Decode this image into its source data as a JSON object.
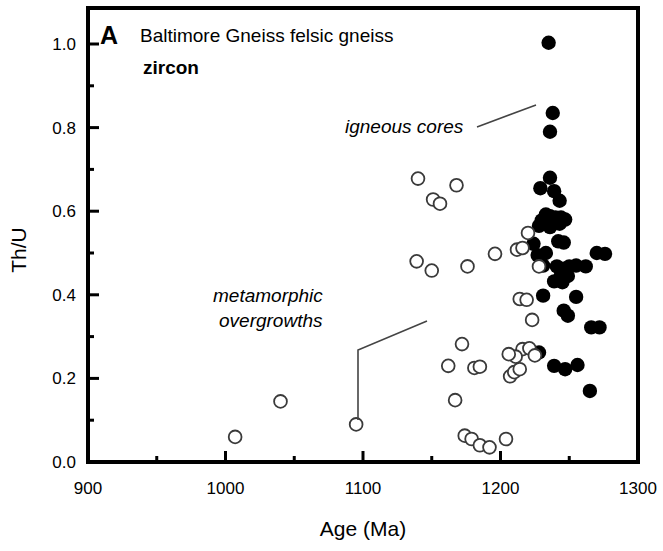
{
  "figure": {
    "panel_label": "A",
    "title_line1": "Baltimore Gneiss felsic gneiss",
    "title_line2": "zircon",
    "annotations": [
      {
        "name": "igneous-cores",
        "text": "igneous cores",
        "text_x": 345,
        "text_y": 133,
        "leader": [
          [
            477,
            127
          ],
          [
            536,
            105
          ]
        ]
      },
      {
        "name": "metamorphic-overgrowths-line1",
        "text": "metamorphic",
        "text_x": 213,
        "text_y": 302,
        "leader": []
      },
      {
        "name": "metamorphic-overgrowths-line2",
        "text": "overgrowths",
        "text_x": 219,
        "text_y": 327,
        "leader": [
          [
            358,
            420
          ],
          [
            358,
            350
          ],
          [
            427,
            321
          ]
        ]
      }
    ]
  },
  "chart_data": {
    "type": "scatter",
    "xlabel": "Age (Ma)",
    "ylabel": "Th/U",
    "xlim": [
      900,
      1300
    ],
    "ylim": [
      0.0,
      1.086
    ],
    "xticks": [
      900,
      1000,
      1100,
      1200,
      1300
    ],
    "xticklabels": [
      "900",
      "1000",
      "1100",
      "1200",
      "1300"
    ],
    "xminorticks": [
      950,
      1050,
      1150,
      1250
    ],
    "yticks": [
      0.0,
      0.2,
      0.4,
      0.6,
      0.8,
      1.0
    ],
    "yticklabels": [
      "0.0",
      "0.2",
      "0.4",
      "0.6",
      "0.8",
      "1.0"
    ],
    "yminorticks": [
      0.1,
      0.3,
      0.5,
      0.7,
      0.9
    ],
    "grid": false,
    "legend": "none",
    "marker_colors": {
      "filled": "#000000",
      "open_stroke": "#3a3a3a",
      "open_fill": "#ffffff"
    },
    "series": [
      {
        "name": "igneous cores",
        "marker": "filled-circle",
        "points": [
          [
            1235,
            1.003
          ],
          [
            1238,
            0.835
          ],
          [
            1236,
            0.79
          ],
          [
            1236,
            0.68
          ],
          [
            1229,
            0.655
          ],
          [
            1239,
            0.648
          ],
          [
            1243,
            0.625
          ],
          [
            1233,
            0.592
          ],
          [
            1236,
            0.588
          ],
          [
            1240,
            0.585
          ],
          [
            1244,
            0.585
          ],
          [
            1230,
            0.578
          ],
          [
            1239,
            0.572
          ],
          [
            1243,
            0.57
          ],
          [
            1247,
            0.58
          ],
          [
            1236,
            0.562
          ],
          [
            1228,
            0.565
          ],
          [
            1242,
            0.528
          ],
          [
            1246,
            0.525
          ],
          [
            1224,
            0.522
          ],
          [
            1233,
            0.5
          ],
          [
            1227,
            0.495
          ],
          [
            1270,
            0.5
          ],
          [
            1276,
            0.498
          ],
          [
            1231,
            0.47
          ],
          [
            1241,
            0.468
          ],
          [
            1246,
            0.462
          ],
          [
            1250,
            0.468
          ],
          [
            1255,
            0.47
          ],
          [
            1244,
            0.448
          ],
          [
            1249,
            0.445
          ],
          [
            1262,
            0.468
          ],
          [
            1239,
            0.432
          ],
          [
            1245,
            0.43
          ],
          [
            1231,
            0.398
          ],
          [
            1255,
            0.395
          ],
          [
            1246,
            0.362
          ],
          [
            1249,
            0.35
          ],
          [
            1266,
            0.322
          ],
          [
            1272,
            0.322
          ],
          [
            1228,
            0.262
          ],
          [
            1239,
            0.23
          ],
          [
            1247,
            0.222
          ],
          [
            1256,
            0.232
          ],
          [
            1265,
            0.17
          ]
        ]
      },
      {
        "name": "metamorphic overgrowths",
        "marker": "open-circle",
        "points": [
          [
            1007,
            0.06
          ],
          [
            1040,
            0.145
          ],
          [
            1095,
            0.09
          ],
          [
            1140,
            0.678
          ],
          [
            1139,
            0.48
          ],
          [
            1150,
            0.458
          ],
          [
            1151,
            0.628
          ],
          [
            1156,
            0.618
          ],
          [
            1168,
            0.662
          ],
          [
            1162,
            0.23
          ],
          [
            1172,
            0.282
          ],
          [
            1167,
            0.148
          ],
          [
            1176,
            0.468
          ],
          [
            1181,
            0.225
          ],
          [
            1185,
            0.228
          ],
          [
            1174,
            0.063
          ],
          [
            1179,
            0.055
          ],
          [
            1185,
            0.04
          ],
          [
            1192,
            0.035
          ],
          [
            1196,
            0.498
          ],
          [
            1204,
            0.055
          ],
          [
            1207,
            0.205
          ],
          [
            1210,
            0.215
          ],
          [
            1214,
            0.222
          ],
          [
            1212,
            0.508
          ],
          [
            1216,
            0.512
          ],
          [
            1220,
            0.548
          ],
          [
            1214,
            0.39
          ],
          [
            1219,
            0.388
          ],
          [
            1223,
            0.34
          ],
          [
            1216,
            0.27
          ],
          [
            1221,
            0.272
          ],
          [
            1211,
            0.252
          ],
          [
            1206,
            0.258
          ],
          [
            1225,
            0.255
          ],
          [
            1228,
            0.468
          ]
        ]
      }
    ]
  },
  "axes": {
    "x_axis_name": "age-axis",
    "y_axis_name": "thu-axis"
  }
}
